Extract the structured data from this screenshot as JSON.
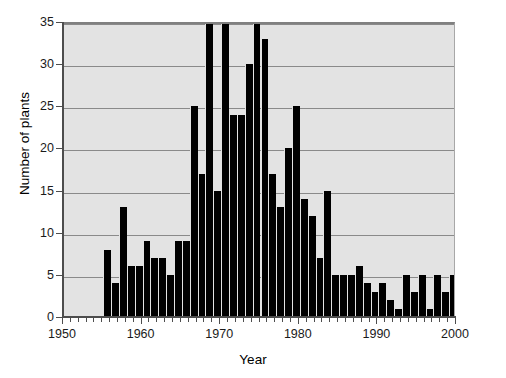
{
  "chart_data": {
    "type": "bar",
    "title": "",
    "xlabel": "Year",
    "ylabel": "Number of plants",
    "xlim": [
      1950,
      2000
    ],
    "ylim": [
      0,
      35
    ],
    "ytick_labels": [
      "0",
      "5",
      "10",
      "15",
      "20",
      "25",
      "30",
      "35"
    ],
    "ytick_values": [
      0,
      5,
      10,
      15,
      20,
      25,
      30,
      35
    ],
    "xtick_labels": [
      "1950",
      "1960",
      "1970",
      "1980",
      "1990",
      "2000"
    ],
    "xtick_values": [
      1950,
      1960,
      1970,
      1980,
      1990,
      2000
    ],
    "xtick_minor_step": 1,
    "grid": "horizontal",
    "legend": "none",
    "bar_color": "#000000",
    "plot_background": "#e3e3e3",
    "note_clipped": "Bars at 1967, 1969 and 1973 are clipped at the top of the axis (35).",
    "categories": [
      1955,
      1956,
      1957,
      1958,
      1959,
      1960,
      1961,
      1962,
      1963,
      1964,
      1965,
      1966,
      1967,
      1968,
      1969,
      1970,
      1971,
      1972,
      1973,
      1974,
      1975,
      1976,
      1977,
      1978,
      1979,
      1980,
      1981,
      1982,
      1983,
      1984,
      1985,
      1986,
      1987,
      1988,
      1989,
      1990,
      1991,
      1992,
      1993,
      1994,
      1995,
      1996,
      1997,
      1998,
      1999
    ],
    "values": [
      8,
      4,
      13,
      6,
      6,
      9,
      7,
      7,
      5,
      9,
      9,
      25,
      17,
      35,
      15,
      35,
      24,
      24,
      30,
      35,
      33,
      17,
      13,
      20,
      25,
      14,
      12,
      7,
      15,
      5,
      5,
      5,
      6,
      4,
      3,
      4,
      2,
      1,
      5,
      3,
      5,
      1,
      5,
      3,
      5
    ],
    "series": [
      {
        "name": "Number of plants",
        "values": [
          8,
          4,
          13,
          6,
          6,
          9,
          7,
          7,
          5,
          9,
          9,
          25,
          17,
          35,
          15,
          35,
          24,
          24,
          30,
          35,
          33,
          17,
          13,
          20,
          25,
          14,
          12,
          7,
          15,
          5,
          5,
          5,
          6,
          4,
          3,
          4,
          2,
          1,
          5,
          3,
          5,
          1,
          5,
          3,
          5
        ]
      }
    ]
  }
}
